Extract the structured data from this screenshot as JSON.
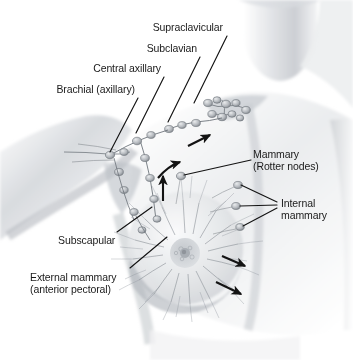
{
  "figure": {
    "background_color": "#ffffff",
    "ink_color": "#1a1a1a",
    "shading_color": "#9aa0a6"
  },
  "labels": [
    {
      "id": "supraclavicular",
      "name": "label-supraclavicular",
      "text": "Supraclavicular",
      "align": "right",
      "x": 118,
      "y": 22,
      "width": 105
    },
    {
      "id": "subclavian",
      "name": "label-subclavian",
      "text": "Subclavian",
      "align": "right",
      "x": 105,
      "y": 43,
      "width": 92
    },
    {
      "id": "central-axillary",
      "name": "label-central-axillary",
      "text": "Central axillary",
      "align": "right",
      "x": 54,
      "y": 63,
      "width": 107
    },
    {
      "id": "brachial-axillary",
      "name": "label-brachial-axillary",
      "text": "Brachial (axillary)",
      "align": "right",
      "x": 12,
      "y": 84,
      "width": 123
    },
    {
      "id": "mammary-rotter",
      "name": "label-mammary-rotter-nodes",
      "text": "Mammary\n(Rotter nodes)",
      "align": "left",
      "x": 253,
      "y": 149,
      "width": 96
    },
    {
      "id": "internal-mammary",
      "name": "label-internal-mammary",
      "text": "Internal\nmammary",
      "align": "left",
      "x": 281,
      "y": 198,
      "width": 70
    },
    {
      "id": "subscapular",
      "name": "label-subscapular",
      "text": "Subscapular",
      "align": "left",
      "x": 58,
      "y": 235,
      "width": 86
    },
    {
      "id": "external-mammary",
      "name": "label-external-mammary-anterior-pectoral",
      "text": "External mammary\n(anterior pectoral)",
      "align": "left",
      "x": 30,
      "y": 272,
      "width": 126
    }
  ],
  "leader_lines": [
    {
      "id": "leader-supraclavicular",
      "x1": 227,
      "y1": 36,
      "x2": 194,
      "y2": 103
    },
    {
      "id": "leader-subclavian",
      "x1": 200,
      "y1": 57,
      "x2": 168,
      "y2": 122
    },
    {
      "id": "leader-central-axillary",
      "x1": 164,
      "y1": 77,
      "x2": 136,
      "y2": 133
    },
    {
      "id": "leader-brachial-axillary",
      "x1": 138,
      "y1": 98,
      "x2": 110,
      "y2": 153
    },
    {
      "id": "leader-rotter",
      "x1": 251,
      "y1": 160,
      "x2": 182,
      "y2": 176
    },
    {
      "id": "leader-internal-mammary-top",
      "x1": 277,
      "y1": 202,
      "x2": 238,
      "y2": 185
    },
    {
      "id": "leader-internal-mammary-mid",
      "x1": 277,
      "y1": 205,
      "x2": 237,
      "y2": 206
    },
    {
      "id": "leader-internal-mammary-low",
      "x1": 277,
      "y1": 208,
      "x2": 240,
      "y2": 227
    },
    {
      "id": "leader-subscapular",
      "x1": 117,
      "y1": 232,
      "x2": 152,
      "y2": 208
    },
    {
      "id": "leader-external-mammary",
      "x1": 130,
      "y1": 268,
      "x2": 166,
      "y2": 238
    }
  ],
  "flow_arrows": [
    {
      "id": "arrow-to-supraclavicular",
      "x1": 188,
      "y1": 146,
      "x2": 213,
      "y2": 134
    },
    {
      "id": "arrow-up-axillary",
      "x1": 163,
      "y1": 201,
      "x2": 163,
      "y2": 172
    },
    {
      "id": "arrow-curved-medial",
      "x1": 160,
      "y1": 174,
      "x2": 182,
      "y2": 160
    },
    {
      "id": "arrow-lateral-upper",
      "x1": 222,
      "y1": 256,
      "x2": 248,
      "y2": 268
    },
    {
      "id": "arrow-lateral-lower",
      "x1": 216,
      "y1": 282,
      "x2": 244,
      "y2": 296
    }
  ],
  "nodes": {
    "supraclavicular_cluster": {
      "cx": 226,
      "cy": 109,
      "count": 9
    },
    "axillary_chain_count": 12,
    "rotter_node": {
      "cx": 181,
      "cy": 176
    },
    "internal_mammary_nodes": [
      {
        "cx": 238,
        "cy": 185
      },
      {
        "cx": 236,
        "cy": 206
      },
      {
        "cx": 240,
        "cy": 227
      }
    ]
  },
  "breast": {
    "center_x": 185,
    "center_y": 248,
    "radius": 58,
    "areola_radius": 15,
    "nipple_radius": 5,
    "radiating_vessel_count": 64
  }
}
